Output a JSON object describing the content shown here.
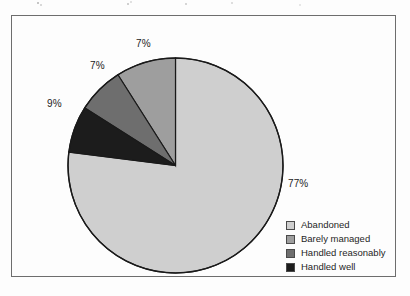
{
  "chart_data": {
    "type": "pie",
    "title": "",
    "subtitle": "",
    "xlabel": "",
    "ylabel": "",
    "grid": false,
    "legend_position": "bottom-right",
    "start_angle_deg": 0,
    "direction": "counterclockwise",
    "categories": [
      "Abandoned",
      "Barely managed",
      "Handled reasonably",
      "Handled well"
    ],
    "values": [
      77,
      9,
      7,
      7
    ],
    "value_unit": "%",
    "data_labels": [
      "77%",
      "9%",
      "7%",
      "7%"
    ],
    "colors": [
      "#cfcfcf",
      "#9e9e9e",
      "#6e6e6e",
      "#1c1c1c"
    ],
    "slices": [
      {
        "label": "Abandoned",
        "value": 77,
        "display": "77%",
        "color": "#cfcfcf"
      },
      {
        "label": "Barely managed",
        "value": 9,
        "display": "9%",
        "color": "#9e9e9e"
      },
      {
        "label": "Handled reasonably",
        "value": 7,
        "display": "7%",
        "color": "#6e6e6e"
      },
      {
        "label": "Handled well",
        "value": 7,
        "display": "7%",
        "color": "#1c1c1c"
      }
    ]
  },
  "labels": {
    "abandoned_pct": "77%",
    "barely_managed_pct": "9%",
    "handled_reasonably_pct": "7%",
    "handled_well_pct": "7%"
  },
  "legend": {
    "items": [
      {
        "label": "Abandoned",
        "color": "#cfcfcf"
      },
      {
        "label": "Barely managed",
        "color": "#9e9e9e"
      },
      {
        "label": "Handled reasonably",
        "color": "#6e6e6e"
      },
      {
        "label": "Handled well",
        "color": "#1c1c1c"
      }
    ]
  },
  "style": {
    "page_background": "#fdfdfd",
    "frame_border": "#6d6d6d",
    "pie_outline": "#1a1a1a",
    "text_color": "#232323"
  }
}
